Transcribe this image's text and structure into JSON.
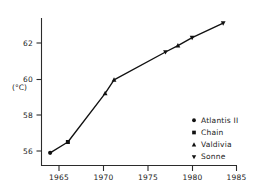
{
  "chart_data": {
    "type": "line",
    "title": "",
    "xlabel": "",
    "ylabel": "(°C)",
    "xlim": [
      1963.0,
      1985.6
    ],
    "ylim": [
      55.2,
      63.6
    ],
    "grid": false,
    "x_ticks": [
      1965,
      1970,
      1975,
      1980,
      1985
    ],
    "x_tick_labels": [
      "1965",
      "1970",
      "1975",
      "1980",
      "1985"
    ],
    "y_ticks": [
      56,
      58,
      60,
      62
    ],
    "y_tick_labels": [
      "56",
      "58",
      "60",
      "62"
    ],
    "legend_position": "lower-right",
    "series": [
      {
        "name": "Atlantis II",
        "marker": "circle",
        "points": [
          {
            "x": 1964.0,
            "y": 55.9
          }
        ]
      },
      {
        "name": "Chain",
        "marker": "square",
        "points": [
          {
            "x": 1966.0,
            "y": 56.5
          }
        ]
      },
      {
        "name": "Valdivia",
        "marker": "triangle-up",
        "points": [
          {
            "x": 1970.2,
            "y": 59.2
          },
          {
            "x": 1971.2,
            "y": 59.95
          },
          {
            "x": 1978.4,
            "y": 61.85
          }
        ]
      },
      {
        "name": "Sonne",
        "marker": "triangle-down",
        "points": [
          {
            "x": 1977.0,
            "y": 61.5
          },
          {
            "x": 1980.0,
            "y": 62.3
          },
          {
            "x": 1983.5,
            "y": 63.1
          }
        ]
      }
    ],
    "connected_path": [
      {
        "x": 1964.0,
        "y": 55.9,
        "marker": "circle",
        "series": "Atlantis II"
      },
      {
        "x": 1966.0,
        "y": 56.5,
        "marker": "square",
        "series": "Chain"
      },
      {
        "x": 1970.2,
        "y": 59.2,
        "marker": "triangle-up",
        "series": "Valdivia"
      },
      {
        "x": 1971.2,
        "y": 59.95,
        "marker": "triangle-up",
        "series": "Valdivia"
      },
      {
        "x": 1977.0,
        "y": 61.5,
        "marker": "triangle-down",
        "series": "Sonne"
      },
      {
        "x": 1978.4,
        "y": 61.85,
        "marker": "triangle-up",
        "series": "Valdivia"
      },
      {
        "x": 1980.0,
        "y": 62.3,
        "marker": "triangle-down",
        "series": "Sonne"
      },
      {
        "x": 1983.5,
        "y": 63.1,
        "marker": "triangle-down",
        "series": "Sonne"
      }
    ],
    "legend": [
      {
        "label": "Atlantis II",
        "marker": "circle"
      },
      {
        "label": "Chain",
        "marker": "square"
      },
      {
        "label": "Valdivia",
        "marker": "triangle-up"
      },
      {
        "label": "Sonne",
        "marker": "triangle-down"
      }
    ],
    "colors": {
      "line": "#111111",
      "marker": "#111111",
      "axis": "#2b2b2b",
      "text": "#1a1a1a",
      "background": "#ffffff"
    }
  }
}
